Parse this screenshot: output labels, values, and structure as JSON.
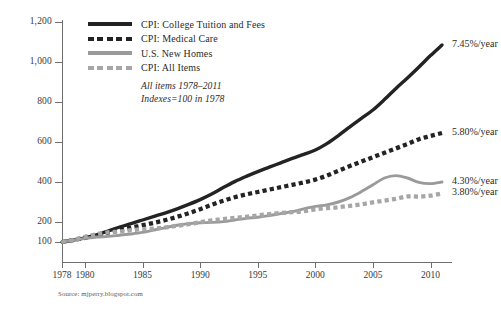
{
  "chart_data": {
    "type": "line",
    "title": "",
    "subtitle_lines": [
      "All items 1978–2011",
      "Indexes=100 in 1978"
    ],
    "xlabel": "",
    "ylabel": "",
    "xlim": [
      1978,
      2011
    ],
    "ylim": [
      0,
      1200
    ],
    "grid": false,
    "legend_position": "top-left",
    "source": "Source: mjperry.blogspot.com",
    "y_ticks": [
      {
        "value": 1200,
        "label": "1,200"
      },
      {
        "value": 1000,
        "label": "1,000"
      },
      {
        "value": 800,
        "label": "800"
      },
      {
        "value": 600,
        "label": "600"
      },
      {
        "value": 400,
        "label": "400"
      },
      {
        "value": 200,
        "label": "200"
      },
      {
        "value": 100,
        "label": "100"
      }
    ],
    "x_ticks": [
      {
        "value": 1978,
        "label": "1978"
      },
      {
        "value": 1980,
        "label": "1980"
      },
      {
        "value": 1985,
        "label": "1985"
      },
      {
        "value": 1990,
        "label": "1990"
      },
      {
        "value": 1995,
        "label": "1995"
      },
      {
        "value": 2000,
        "label": "2000"
      },
      {
        "value": 2005,
        "label": "2005"
      },
      {
        "value": 2010,
        "label": "2010"
      }
    ],
    "x": [
      1978,
      1979,
      1980,
      1981,
      1982,
      1983,
      1984,
      1985,
      1986,
      1987,
      1988,
      1989,
      1990,
      1991,
      1992,
      1993,
      1994,
      1995,
      1996,
      1997,
      1998,
      1999,
      2000,
      2001,
      2002,
      2003,
      2004,
      2005,
      2006,
      2007,
      2008,
      2009,
      2010,
      2011
    ],
    "series": [
      {
        "name": "CPI: College Tuition and Fees",
        "color": "#232323",
        "style": "solid",
        "annotation": "7.45%/year",
        "values": [
          100,
          110,
          121,
          136,
          155,
          175,
          192,
          210,
          228,
          246,
          266,
          288,
          312,
          340,
          372,
          402,
          428,
          452,
          474,
          496,
          518,
          538,
          560,
          592,
          632,
          676,
          718,
          760,
          812,
          868,
          920,
          975,
          1032,
          1085
        ]
      },
      {
        "name": "CPI: Medical Care",
        "color": "#232323",
        "style": "dashed",
        "annotation": "5.80%/year",
        "values": [
          100,
          110,
          121,
          133,
          147,
          160,
          172,
          184,
          196,
          210,
          226,
          244,
          264,
          286,
          306,
          324,
          338,
          350,
          362,
          374,
          386,
          398,
          412,
          432,
          456,
          480,
          502,
          524,
          546,
          568,
          590,
          614,
          630,
          645
        ]
      },
      {
        "name": "U.S. New Homes",
        "color": "#9a9a9a",
        "style": "solid",
        "annotation": "4.30%/year",
        "values": [
          100,
          110,
          118,
          125,
          128,
          134,
          140,
          148,
          160,
          172,
          184,
          192,
          196,
          198,
          202,
          210,
          218,
          224,
          232,
          242,
          252,
          266,
          278,
          286,
          300,
          322,
          352,
          386,
          420,
          432,
          420,
          398,
          392,
          400
        ]
      },
      {
        "name": "CPI: All Items",
        "color": "#a6a6a6",
        "style": "dashed",
        "annotation": "3.80%/year",
        "values": [
          100,
          111,
          126,
          139,
          148,
          152,
          159,
          164,
          167,
          173,
          181,
          189,
          199,
          208,
          214,
          221,
          226,
          233,
          239,
          245,
          249,
          254,
          263,
          270,
          274,
          281,
          288,
          298,
          307,
          316,
          328,
          327,
          332,
          343
        ]
      }
    ]
  }
}
